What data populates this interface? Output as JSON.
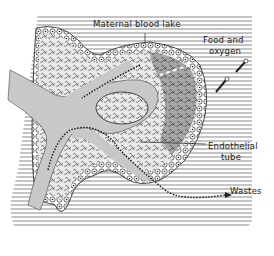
{
  "figure": {
    "type": "scientific-illustration",
    "labels": {
      "maternal_blood_lake": "Maternal blood lake",
      "food_and_oxygen_line1": "Food and",
      "food_and_oxygen_line2": "oxygen",
      "endothelial_tube_line1": "Endothelial",
      "endothelial_tube_line2": "tube",
      "wastes": "Wastes"
    },
    "colors": {
      "background": "#ffffff",
      "hatch": "#8a8a8a",
      "vessel_fill": "#c8c8c8",
      "tissue_fill": "#e6e6e6",
      "ink": "#222222"
    }
  }
}
